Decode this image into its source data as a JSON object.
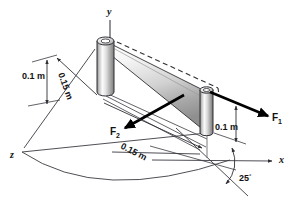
{
  "figure": {
    "background_color": "#ffffff",
    "line_color": "#3a3a42",
    "force_color": "#000000"
  },
  "axes": [
    {
      "name": "y-axis",
      "label": "y",
      "x": 111,
      "y": 14
    },
    {
      "name": "x-axis",
      "label": "x",
      "x": 279,
      "y": 163
    },
    {
      "name": "z-axis",
      "label": "z",
      "x": 12,
      "y": 157
    }
  ],
  "dimensions": [
    {
      "name": "left-height-dimension",
      "label": "0.1 m",
      "x": 27,
      "y": 76,
      "rotation": 0
    },
    {
      "name": "left-depth-dimension",
      "label": "0.15 m",
      "x": 62,
      "y": 80,
      "rotation": 71
    },
    {
      "name": "ground-span-dimension",
      "label": "0.15 m",
      "x": 128,
      "y": 138,
      "rotation": 29
    },
    {
      "name": "right-height-dimension",
      "label": "0.1 m",
      "x": 216,
      "y": 127,
      "rotation": 0
    }
  ],
  "forces": [
    {
      "name": "force-f1",
      "label": "F",
      "subscript": "1",
      "x": 276,
      "y": 116
    },
    {
      "name": "force-f2",
      "label": "F",
      "subscript": "2",
      "x": 114,
      "y": 131
    }
  ],
  "angle": {
    "name": "angle-25-degrees",
    "value": "25",
    "unit": "°",
    "x": 243,
    "y": 180
  },
  "colors": {
    "cylinder_light": "#f2f2f2",
    "cylinder_mid": "#cfcfcf",
    "cylinder_dark": "#8a8a8a",
    "panel_light": "#fbfbfb",
    "panel_dark": "#9c9c9c",
    "outline": "#2f2f35"
  }
}
